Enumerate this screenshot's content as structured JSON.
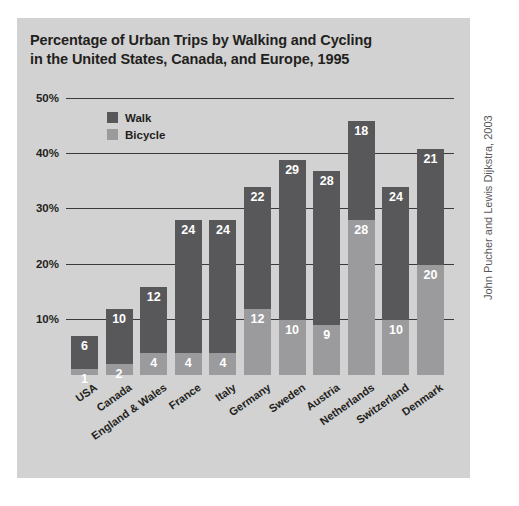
{
  "title": {
    "line1": "Percentage of Urban Trips by Walking and Cycling",
    "line2": "in the United States, Canada, and Europe, 1995"
  },
  "attribution": "John Pucher and Lewis Dijkstra, 2003",
  "legend": {
    "walk_label": "Walk",
    "bicycle_label": "Bicycle"
  },
  "colors": {
    "walk": "#58585a",
    "bicycle": "#9b9b9d",
    "panel": "#d2d2d2",
    "axis": "#3a3a3a",
    "text": "#231f20",
    "value_text": "#ffffff"
  },
  "chart_data": {
    "type": "bar",
    "subtype": "stacked",
    "title": "Percentage of Urban Trips by Walking and Cycling in the United States, Canada, and Europe, 1995",
    "xlabel": "",
    "ylabel": "",
    "ylim": [
      0,
      50
    ],
    "ytick_labels": [
      "10%",
      "20%",
      "30%",
      "40%",
      "50%"
    ],
    "ytick_values": [
      10,
      20,
      30,
      40,
      50
    ],
    "grid": true,
    "legend_position": "top-left-inside",
    "categories": [
      "USA",
      "Canada",
      "England & Wales",
      "France",
      "Italy",
      "Germany",
      "Sweden",
      "Austria",
      "Netherlands",
      "Switzerland",
      "Denmark"
    ],
    "series": [
      {
        "name": "Bicycle",
        "color": "#9b9b9d",
        "stack_position": "bottom",
        "values": [
          1,
          2,
          4,
          4,
          4,
          12,
          10,
          9,
          28,
          10,
          20
        ]
      },
      {
        "name": "Walk",
        "color": "#58585a",
        "stack_position": "top",
        "values": [
          6,
          10,
          12,
          24,
          24,
          22,
          29,
          28,
          18,
          24,
          21
        ]
      }
    ],
    "totals": [
      7,
      12,
      16,
      28,
      28,
      34,
      39,
      37,
      46,
      34,
      41
    ]
  }
}
